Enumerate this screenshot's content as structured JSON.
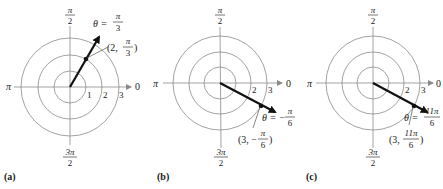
{
  "figure": {
    "panels": [
      {
        "id": "a",
        "caption": "(a)",
        "center": [
          70,
          87
        ],
        "ring_radii": [
          16,
          32,
          49
        ],
        "ring_labels": [
          "1",
          "2",
          "3"
        ],
        "axis_labels": {
          "right": "0",
          "left": "π",
          "top_num": "π",
          "top_den": "2",
          "bottom_num": "3π",
          "bottom_den": "2"
        },
        "ray": {
          "angle_label_prefix": "θ =",
          "angle_num": "π",
          "angle_den": "3"
        },
        "point": {
          "open": "(2,",
          "num": "π",
          "den": "3",
          "close": ")"
        }
      },
      {
        "id": "b",
        "caption": "(b)",
        "center": [
          220,
          83
        ],
        "ring_radii": [
          16,
          31,
          47
        ],
        "ring_labels": [
          "2",
          "3"
        ],
        "axis_labels": {
          "right": "0",
          "left": "π",
          "top_num": "π",
          "top_den": "2",
          "bottom_num": "3π",
          "bottom_den": "2"
        },
        "ray": {
          "angle_label_prefix": "θ = −",
          "angle_num": "π",
          "angle_den": "6"
        },
        "point": {
          "open": "(3, −",
          "num": "π",
          "den": "6",
          "close": ")"
        }
      },
      {
        "id": "c",
        "caption": "(c)",
        "center": [
          373,
          83
        ],
        "ring_radii": [
          16,
          31,
          47
        ],
        "ring_labels": [
          "2",
          "3"
        ],
        "axis_labels": {
          "right": "0",
          "left": "π",
          "top_num": "π",
          "top_den": "2",
          "bottom_num": "3π",
          "bottom_den": "2"
        },
        "ray": {
          "angle_label_prefix": "θ =",
          "angle_num": "11π",
          "angle_den": "6"
        },
        "point": {
          "open": "(3,",
          "num": "11π",
          "den": "6",
          "close": ")"
        }
      }
    ]
  }
}
